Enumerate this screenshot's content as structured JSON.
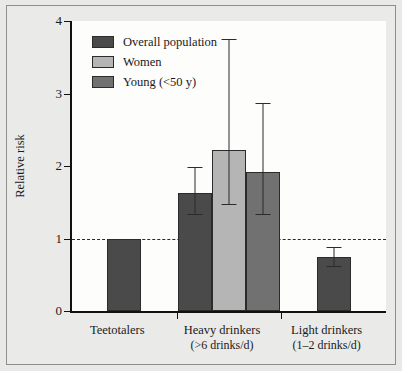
{
  "chart_data": {
    "type": "bar",
    "title": "",
    "xlabel": "",
    "ylabel": "Relative risk",
    "ylim": [
      0,
      4
    ],
    "yticks": [
      0,
      1,
      2,
      3,
      4
    ],
    "ytick_labels": [
      "0",
      "1",
      "2",
      "3",
      "4"
    ],
    "grid": false,
    "legend_position": "top-left",
    "reference_line": {
      "value": 1,
      "style": "dashed",
      "color": "#2a2a2a"
    },
    "categories": [
      {
        "label": "Teetotalers",
        "sublabel": ""
      },
      {
        "label": "Heavy drinkers",
        "sublabel": "(>6 drinks/d)"
      },
      {
        "label": "Light drinkers",
        "sublabel": "(1–2 drinks/d)"
      }
    ],
    "series": [
      {
        "name": "Overall population",
        "color": "#4a4a4a",
        "values": [
          1.0,
          1.63,
          0.75
        ],
        "ci_low": [
          null,
          1.32,
          0.6
        ],
        "ci_high": [
          null,
          1.99,
          0.88
        ]
      },
      {
        "name": "Women",
        "color": "#b5b5b5",
        "values": [
          null,
          2.22,
          null
        ],
        "ci_low": [
          null,
          1.46,
          null
        ],
        "ci_high": [
          null,
          3.75,
          null
        ]
      },
      {
        "name": "Young (<50 y)",
        "color": "#717171",
        "values": [
          null,
          1.92,
          null
        ],
        "ci_low": [
          null,
          1.32,
          null
        ],
        "ci_high": [
          null,
          2.87,
          null
        ]
      }
    ]
  },
  "legend": {
    "items": [
      {
        "label": "Overall population",
        "color": "#4a4a4a"
      },
      {
        "label": "Women",
        "color": "#b5b5b5"
      },
      {
        "label": "Young (<50 y)",
        "color": "#717171"
      }
    ]
  },
  "colors": {
    "overall": "#4a4a4a",
    "women": "#b5b5b5",
    "young": "#717171",
    "axis": "#111111",
    "plot_background": "#fdfdfc",
    "page_background": "#e9e9e7"
  }
}
